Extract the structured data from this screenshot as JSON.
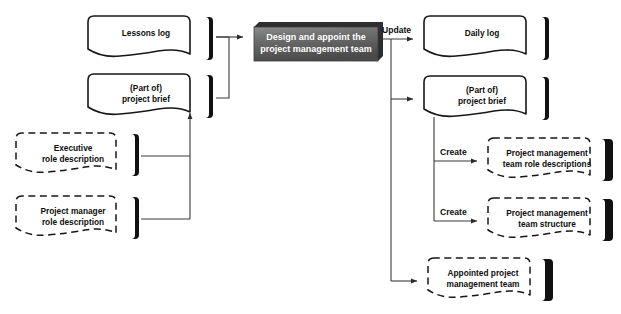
{
  "diagram": {
    "background_color": "#ffffff",
    "process": {
      "id": "design-appoint-pm-team",
      "label_line1": "Design and appoint the",
      "label_line2": "project management team",
      "fill_color": "#6b6b6b",
      "text_color": "#ffffff",
      "x": 254,
      "y": 22,
      "w": 124,
      "h": 34
    },
    "inputs": [
      {
        "id": "lessons-log",
        "label_line1": "Lessons log",
        "label_line2": "",
        "style": "solid",
        "x": 88,
        "y": 16,
        "w": 126,
        "h": 47
      },
      {
        "id": "part-of-project-brief-in",
        "label_line1": "(Part of)",
        "label_line2": "project brief",
        "style": "solid",
        "x": 88,
        "y": 74,
        "w": 126,
        "h": 47
      },
      {
        "id": "executive-role-description",
        "label_line1": "Executive",
        "label_line2": "role description",
        "style": "dashed",
        "x": 16,
        "y": 133,
        "w": 124,
        "h": 46
      },
      {
        "id": "project-manager-role-description",
        "label_line1": "Project manager",
        "label_line2": "role description",
        "style": "dashed",
        "x": 16,
        "y": 196,
        "w": 124,
        "h": 46
      }
    ],
    "outputs": [
      {
        "id": "daily-log",
        "label_line1": "Daily log",
        "label_line2": "",
        "style": "solid",
        "x": 424,
        "y": 16,
        "w": 126,
        "h": 47
      },
      {
        "id": "part-of-project-brief-out",
        "label_line1": "(Part of)",
        "label_line2": "project brief",
        "style": "solid",
        "x": 424,
        "y": 76,
        "w": 126,
        "h": 47
      },
      {
        "id": "pm-team-role-descriptions",
        "label_line1": "Project management",
        "label_line2": "team role descriptions",
        "style": "dashed",
        "x": 488,
        "y": 138,
        "w": 126,
        "h": 46
      },
      {
        "id": "pm-team-structure",
        "label_line1": "Project management",
        "label_line2": "team structure",
        "style": "dashed",
        "x": 488,
        "y": 198,
        "w": 126,
        "h": 46
      },
      {
        "id": "appointed-pm-team",
        "label_line1": "Appointed project",
        "label_line2": "management team",
        "style": "dashed",
        "x": 428,
        "y": 258,
        "w": 126,
        "h": 46
      }
    ],
    "edge_labels": [
      {
        "id": "update-label",
        "text": "Update",
        "x": 382,
        "y": 35
      },
      {
        "id": "create-label-1",
        "text": "Create",
        "x": 440,
        "y": 152
      },
      {
        "id": "create-label-2",
        "text": "Create",
        "x": 440,
        "y": 212
      }
    ]
  }
}
